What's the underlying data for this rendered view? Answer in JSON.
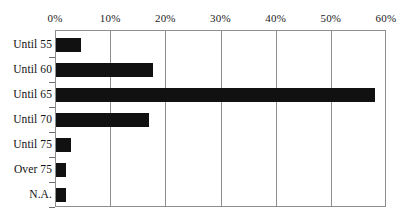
{
  "chart_data": {
    "type": "bar",
    "orientation": "horizontal",
    "title": "",
    "subtitle": "",
    "xlabel": "",
    "ylabel": "",
    "categories": [
      "Until 55",
      "Until 60",
      "Until 65",
      "Until 70",
      "Until 75",
      "Over 75",
      "N.A."
    ],
    "values": [
      4.5,
      17.6,
      57.8,
      16.8,
      2.7,
      1.8,
      1.8
    ],
    "value_unit": "%",
    "xlim": [
      0,
      60
    ],
    "xticks": [
      0,
      10,
      20,
      30,
      40,
      50,
      60
    ],
    "xtick_labels": [
      "0%",
      "10%",
      "20%",
      "30%",
      "40%",
      "50%",
      "60%"
    ],
    "xaxis_position": "top",
    "grid": true,
    "grid_axis": "x",
    "legend": false,
    "legend_position": "none",
    "bar_color": "#111111",
    "frame_color": "#8d8d8d",
    "background_color": "#ffffff",
    "series": [
      {
        "name": "",
        "values": [
          4.5,
          17.6,
          57.8,
          16.8,
          2.7,
          1.8,
          1.8
        ]
      }
    ]
  }
}
